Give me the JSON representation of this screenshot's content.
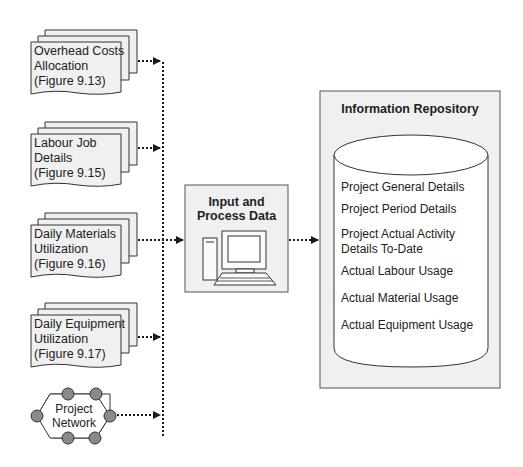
{
  "documents": [
    {
      "lines": [
        "Overhead Costs",
        "Allocation",
        "(Figure 9.13)"
      ]
    },
    {
      "lines": [
        "Labour Job",
        "Details",
        "(Figure 9.15)"
      ]
    },
    {
      "lines": [
        "Daily Materials",
        "Utilization",
        "(Figure 9.16)"
      ]
    },
    {
      "lines": [
        "Daily Equipment",
        "Utilization",
        "(Figure 9.17)"
      ]
    }
  ],
  "network": {
    "lines": [
      "Project",
      "Network"
    ]
  },
  "process": {
    "title_lines": [
      "Input and",
      "Process Data"
    ],
    "icon": "computer-icon"
  },
  "repository": {
    "title": "Information Repository",
    "icon": "database-cylinder-icon",
    "items": [
      {
        "lines": [
          "Project General Details"
        ]
      },
      {
        "lines": [
          "Project Period Details"
        ]
      },
      {
        "lines": [
          "Project Actual Activity",
          "Details To-Date"
        ]
      },
      {
        "lines": [
          "Actual Labour Usage"
        ]
      },
      {
        "lines": [
          "Actual Material Usage"
        ]
      },
      {
        "lines": [
          "Actual Equipment Usage"
        ]
      }
    ]
  },
  "colors": {
    "box_fill": "#f0f0f0",
    "doc_fill": "#f0f0f0",
    "stroke": "#333333",
    "node_fill": "#8a8a8a",
    "background": "#ffffff"
  }
}
